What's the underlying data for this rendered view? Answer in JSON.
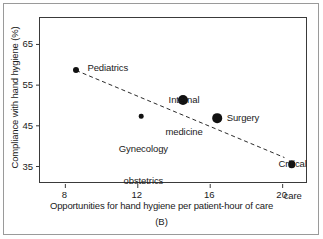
{
  "chart_data": {
    "type": "scatter",
    "title": "",
    "panel": "(B)",
    "xlabel": "Opportunities for hand hygiene per patient-hour of care",
    "ylabel": "Compliance with hand hygiene (%)",
    "xlim": [
      6.6,
      21.4
    ],
    "ylim": [
      30.7,
      71.5
    ],
    "xticks": [
      8,
      12,
      16,
      20
    ],
    "xtick_labels": [
      "8",
      "12",
      "16",
      "20"
    ],
    "yticks": [
      65,
      55,
      45,
      35
    ],
    "ytick_labels": [
      "65",
      "55",
      "45",
      "35"
    ],
    "grid": false,
    "legend": "none",
    "points": [
      {
        "label": "Pediatrics",
        "x": 8.6,
        "y": 58.8,
        "size": 6.0,
        "label_pos": "above-right"
      },
      {
        "label": "Gynecology\nobstetrics",
        "x": 12.2,
        "y": 47.3,
        "size": 4.6,
        "label_pos": "below-center"
      },
      {
        "label": "Internal\nmedicine",
        "x": 14.5,
        "y": 51.3,
        "size": 10.0,
        "label_pos": "above-center"
      },
      {
        "label": "Surgery",
        "x": 16.4,
        "y": 46.8,
        "size": 9.6,
        "label_pos": "above-right"
      },
      {
        "label": "Critical\ncare",
        "x": 20.5,
        "y": 35.5,
        "size": 7.6,
        "label_pos": "above-center"
      }
    ],
    "trendline": {
      "style": "dashed",
      "x_start": 8.6,
      "y_start": 58.6,
      "x_end": 20.1,
      "y_end": 37.2
    },
    "marker_color": "#111111",
    "axis_color": "#3a3a3a"
  },
  "labels": {
    "pediatrics": "Pediatrics",
    "gynecology_line1": "Gynecology",
    "gynecology_line2": "obstetrics",
    "internal_line1": "Internal",
    "internal_line2": "medicine",
    "surgery": "Surgery",
    "critical_line1": "Critical",
    "critical_line2": "care",
    "xaxis_title": "Opportunities for hand hygiene per patient-hour of care",
    "yaxis_title": "Compliance with hand hygiene (%)",
    "panel_label": "(B)",
    "xtick_8": "8",
    "xtick_12": "12",
    "xtick_16": "16",
    "xtick_20": "20",
    "ytick_65": "65",
    "ytick_55": "55",
    "ytick_45": "45",
    "ytick_35": "35"
  }
}
